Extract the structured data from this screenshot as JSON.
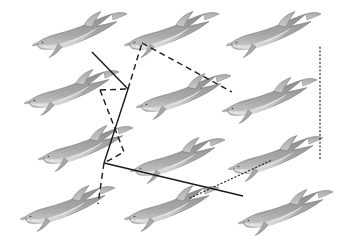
{
  "figure": {
    "width": 352,
    "height": 243,
    "background_color": "#ffffff"
  },
  "palette": {
    "body_dark": "#8c8c8c",
    "body_mid": "#a8a8a8",
    "body_light": "#c9c9c9",
    "belly": "#f2f2f2",
    "outline": "#6e6e6e",
    "line_color": "#1a1a1a",
    "background": "#ffffff"
  },
  "nodes": [
    {
      "id": "d-r1c1",
      "label": "Dolphin R1C1",
      "row": 1,
      "col": 1,
      "x": 32,
      "y": 8,
      "w": 96,
      "h": 52,
      "flip": false
    },
    {
      "id": "d-r1c2",
      "label": "Dolphin R1C2",
      "row": 1,
      "col": 2,
      "x": 124,
      "y": 8,
      "w": 96,
      "h": 52,
      "flip": false
    },
    {
      "id": "d-r1c3",
      "label": "Dolphin R1C3",
      "row": 1,
      "col": 3,
      "x": 226,
      "y": 8,
      "w": 96,
      "h": 52,
      "flip": false
    },
    {
      "id": "d-r2c1",
      "label": "Dolphin R2C1",
      "row": 2,
      "col": 1,
      "x": 24,
      "y": 66,
      "w": 96,
      "h": 52,
      "flip": false
    },
    {
      "id": "d-r2c2",
      "label": "Dolphin R2C2",
      "row": 2,
      "col": 2,
      "x": 136,
      "y": 70,
      "w": 96,
      "h": 52,
      "flip": false
    },
    {
      "id": "d-r2c3",
      "label": "Dolphin R2C3",
      "row": 2,
      "col": 3,
      "x": 222,
      "y": 74,
      "w": 96,
      "h": 52,
      "flip": false
    },
    {
      "id": "d-r3c1",
      "label": "Dolphin R3C1",
      "row": 3,
      "col": 1,
      "x": 38,
      "y": 122,
      "w": 96,
      "h": 52,
      "flip": false
    },
    {
      "id": "d-r3c2",
      "label": "Dolphin R3C2",
      "row": 3,
      "col": 2,
      "x": 130,
      "y": 134,
      "w": 96,
      "h": 52,
      "flip": false
    },
    {
      "id": "d-r3c3",
      "label": "Dolphin R3C3",
      "row": 3,
      "col": 3,
      "x": 228,
      "y": 132,
      "w": 96,
      "h": 52,
      "flip": false
    },
    {
      "id": "d-r4c1",
      "label": "Dolphin R4C1",
      "row": 4,
      "col": 1,
      "x": 20,
      "y": 182,
      "w": 96,
      "h": 52,
      "flip": false
    },
    {
      "id": "d-r4c2",
      "label": "Dolphin R4C2",
      "row": 4,
      "col": 2,
      "x": 124,
      "y": 182,
      "w": 96,
      "h": 52,
      "flip": false
    },
    {
      "id": "d-r4c3",
      "label": "Dolphin R4C3",
      "row": 4,
      "col": 3,
      "x": 238,
      "y": 186,
      "w": 96,
      "h": 52,
      "flip": false
    }
  ],
  "junctions": [
    {
      "id": "j-upper",
      "label": "Upper junction",
      "x": 128,
      "y": 89
    },
    {
      "id": "j-lower",
      "label": "Lower junction",
      "x": 104,
      "y": 163
    }
  ],
  "edges": [
    {
      "id": "e-solid-upper-left",
      "label": "Solid edge to upper-left dolphin",
      "style": "solid",
      "points": "92,52 128,89"
    },
    {
      "id": "e-solid-upper-spine",
      "label": "Solid spine between junctions",
      "style": "solid",
      "points": "128,89 104,163"
    },
    {
      "id": "e-solid-lower-right",
      "label": "Solid edge to lower-right dolphin",
      "style": "solid",
      "points": "104,163 243,196"
    },
    {
      "id": "e-dash-top-node",
      "label": "Dashed edge up to top-centre dolphin",
      "style": "dashed",
      "points": "128,89 142,43"
    },
    {
      "id": "e-dash-top-right",
      "label": "Dashed edge to middle-right dolphin",
      "style": "dashed",
      "points": "142,43 232,92"
    },
    {
      "id": "e-dash-mid-left",
      "label": "Dashed edge to middle-left dolphin",
      "style": "dashed",
      "points": "100,90 128,89"
    },
    {
      "id": "e-dash-lower-spine",
      "label": "Dashed edge down through grid",
      "style": "dashed",
      "points": "100,90 124,152 104,163"
    },
    {
      "id": "e-dash-bottom-left",
      "label": "Dashed edge to bottom-left dolphin",
      "style": "dashed",
      "points": "104,163 98,204"
    },
    {
      "id": "e-dot-right-column",
      "label": "Dotted vertical edge on right column",
      "style": "dotted",
      "points": "320,47 320,159"
    },
    {
      "id": "e-dot-lower-right",
      "label": "Dotted edge to lower-right dolphin",
      "style": "dotted",
      "points": "190,198 272,160"
    }
  ],
  "legend": {
    "solid_label": "Solid connector",
    "dashed_label": "Dashed connector",
    "dotted_label": "Dotted connector"
  }
}
